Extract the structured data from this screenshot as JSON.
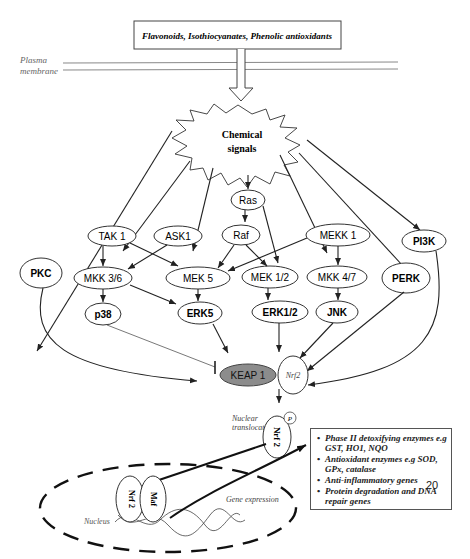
{
  "top_box": {
    "label": "Flavonoids, Isothiocyanates, Phenolic antioxidants"
  },
  "membrane": {
    "line1": "Plasma",
    "line2": "membrane"
  },
  "signal": {
    "line1": "Chemical",
    "line2": "signals"
  },
  "nodes": {
    "ras": "Ras",
    "tak1": "TAK 1",
    "ask1": "ASK1",
    "raf": "Raf",
    "mekk1": "MEKK 1",
    "pi3k": "PI3K",
    "pkc": "PKC",
    "mkk36": "MKK 3/6",
    "mek5": "MEK 5",
    "mek12": "MEK 1/2",
    "mkk47": "MKK 4/7",
    "perk": "PERK",
    "p38": "p38",
    "erk5": "ERK5",
    "erk12": "ERK1/2",
    "jnk": "JNK",
    "keap1": "KEAP 1",
    "nrf2_cyto": "Nrf2",
    "nrf2_nuc": "Nrf 2",
    "phospho": "P",
    "nrf2_dna": "Nrf 2",
    "maf": "Maf"
  },
  "labels": {
    "nuclear_translocation_1": "Nuclear",
    "nuclear_translocation_2": "translocation",
    "gene_expression": "Gene expression",
    "nucleus": "Nucleus"
  },
  "gene_box": {
    "items": [
      "Phase II detoxifying enzymes e.g GST, HO1, NQO",
      "Antioxidant enzymes e.g SOD, GPx, catalase",
      "Anti-inflammatory genes",
      "Protein degradation and DNA repair genes"
    ]
  },
  "page_number": "20",
  "colors": {
    "keap1_fill": "#8c8c8c",
    "line": "#222222"
  }
}
